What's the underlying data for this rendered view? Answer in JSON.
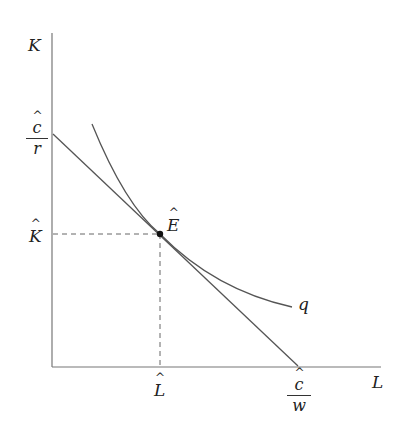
{
  "diagram": {
    "type": "isocost-isoquant",
    "axes": {
      "y_label": "K",
      "x_label": "L"
    },
    "labels": {
      "y_intercept": {
        "numerator": "c",
        "denominator": "r",
        "hat": true
      },
      "x_intercept": {
        "numerator": "c",
        "denominator": "w",
        "hat": true
      },
      "K_hat": "K",
      "L_hat": "L",
      "equilibrium": "E",
      "isoquant": "q"
    },
    "colors": {
      "line": "#555555",
      "dashed": "#666666",
      "point": "#111111",
      "background": "#ffffff"
    }
  }
}
